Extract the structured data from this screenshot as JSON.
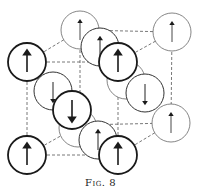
{
  "figure": {
    "caption": "Fig. 8",
    "colors": {
      "stroke": "#1a1a1a",
      "thin_stroke": "#555555",
      "dash": "#555555",
      "background": "#ffffff"
    },
    "atoms": [
      {
        "id": "back-top-left",
        "cx": 80,
        "cy": 30,
        "spin": "up",
        "layer": "back"
      },
      {
        "id": "back-top-right",
        "cx": 172,
        "cy": 32,
        "spin": "up",
        "layer": "back"
      },
      {
        "id": "top-face-center",
        "cx": 100,
        "cy": 47,
        "spin": "up",
        "layer": "middle"
      },
      {
        "id": "back-bottom-right",
        "cx": 171,
        "cy": 123,
        "spin": "up",
        "layer": "back"
      },
      {
        "id": "back-bottom-left",
        "cx": 78,
        "cy": 128,
        "spin": "up",
        "layer": "hidden"
      },
      {
        "id": "right-face-hidden",
        "cx": 126,
        "cy": 80,
        "spin": "down",
        "layer": "hidden"
      },
      {
        "id": "left-face-center",
        "cx": 53,
        "cy": 91,
        "spin": "down",
        "layer": "middle"
      },
      {
        "id": "right-face-center",
        "cx": 145,
        "cy": 93,
        "spin": "down",
        "layer": "middle"
      },
      {
        "id": "bottom-face-center",
        "cx": 98,
        "cy": 140,
        "spin": "up",
        "layer": "middle"
      },
      {
        "id": "body-center",
        "cx": 72,
        "cy": 110,
        "spin": "down",
        "layer": "front"
      },
      {
        "id": "front-top-left",
        "cx": 27,
        "cy": 62,
        "spin": "up",
        "layer": "front"
      },
      {
        "id": "front-top-right",
        "cx": 118,
        "cy": 62,
        "spin": "up",
        "layer": "front"
      },
      {
        "id": "front-bottom-left",
        "cx": 27,
        "cy": 155,
        "spin": "up",
        "layer": "front"
      },
      {
        "id": "front-bottom-right",
        "cx": 118,
        "cy": 155,
        "spin": "up",
        "layer": "front"
      }
    ],
    "radius": 19
  }
}
